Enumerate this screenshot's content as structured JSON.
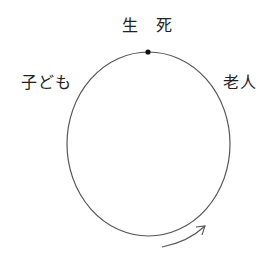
{
  "diagram": {
    "labels": {
      "top": "生　死",
      "left": "子ども",
      "right": "老人"
    },
    "colors": {
      "stroke": "#555555",
      "dot": "#111111",
      "text": "#222222"
    }
  }
}
